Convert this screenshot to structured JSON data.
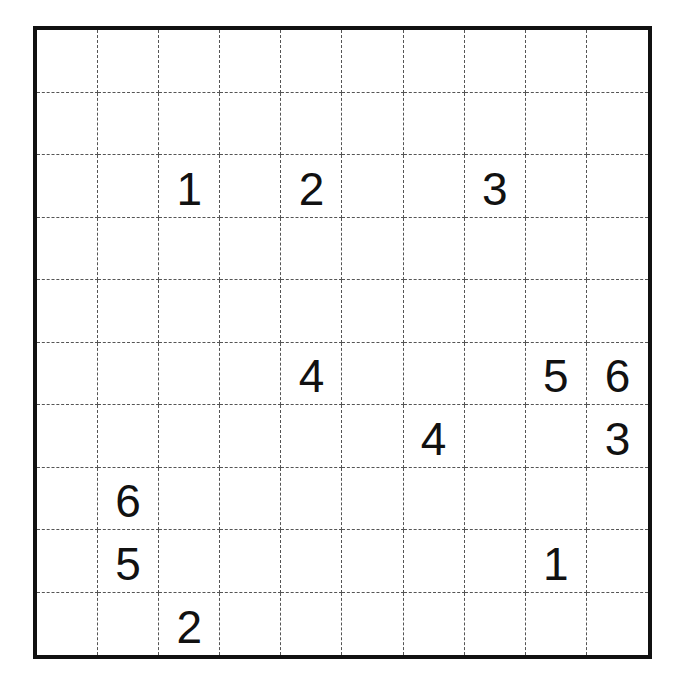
{
  "title": "",
  "puzzle": {
    "rows": 10,
    "cols": 10,
    "colors": {
      "border": "#111111",
      "gridline": "#555555",
      "text": "#111111",
      "background": "#ffffff"
    },
    "clues": [
      {
        "row": 2,
        "col": 2,
        "value": "1"
      },
      {
        "row": 2,
        "col": 4,
        "value": "2"
      },
      {
        "row": 2,
        "col": 7,
        "value": "3"
      },
      {
        "row": 5,
        "col": 4,
        "value": "4"
      },
      {
        "row": 5,
        "col": 8,
        "value": "5"
      },
      {
        "row": 5,
        "col": 9,
        "value": "6"
      },
      {
        "row": 6,
        "col": 6,
        "value": "4"
      },
      {
        "row": 6,
        "col": 9,
        "value": "3"
      },
      {
        "row": 7,
        "col": 1,
        "value": "6"
      },
      {
        "row": 8,
        "col": 1,
        "value": "5"
      },
      {
        "row": 8,
        "col": 8,
        "value": "1"
      },
      {
        "row": 9,
        "col": 2,
        "value": "2"
      }
    ],
    "grid": [
      [
        "",
        "",
        "",
        "",
        "",
        "",
        "",
        "",
        "",
        ""
      ],
      [
        "",
        "",
        "",
        "",
        "",
        "",
        "",
        "",
        "",
        ""
      ],
      [
        "",
        "",
        "1",
        "",
        "2",
        "",
        "",
        "3",
        "",
        ""
      ],
      [
        "",
        "",
        "",
        "",
        "",
        "",
        "",
        "",
        "",
        ""
      ],
      [
        "",
        "",
        "",
        "",
        "",
        "",
        "",
        "",
        "",
        ""
      ],
      [
        "",
        "",
        "",
        "",
        "4",
        "",
        "",
        "",
        "5",
        "6"
      ],
      [
        "",
        "",
        "",
        "",
        "",
        "",
        "4",
        "",
        "",
        "3"
      ],
      [
        "",
        "6",
        "",
        "",
        "",
        "",
        "",
        "",
        "",
        ""
      ],
      [
        "",
        "5",
        "",
        "",
        "",
        "",
        "",
        "",
        "1",
        ""
      ],
      [
        "",
        "",
        "2",
        "",
        "",
        "",
        "",
        "",
        "",
        ""
      ]
    ]
  }
}
